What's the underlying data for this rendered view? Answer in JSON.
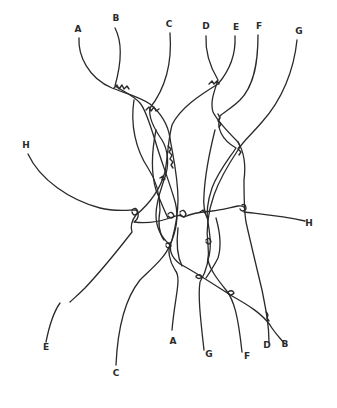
{
  "diagram": {
    "type": "hand-drawn braid / string crossing diagram",
    "top_labels": [
      {
        "text": "A",
        "x": 78,
        "y": 32
      },
      {
        "text": "B",
        "x": 116,
        "y": 21
      },
      {
        "text": "C",
        "x": 169,
        "y": 27
      },
      {
        "text": "D",
        "x": 206,
        "y": 29
      },
      {
        "text": "E",
        "x": 236,
        "y": 30
      },
      {
        "text": "F",
        "x": 259,
        "y": 29
      },
      {
        "text": "G",
        "x": 299,
        "y": 34
      }
    ],
    "left_labels": [
      {
        "text": "H",
        "x": 26,
        "y": 148
      }
    ],
    "right_labels": [
      {
        "text": "H",
        "x": 309,
        "y": 226
      }
    ],
    "bottom_labels": [
      {
        "text": "E",
        "x": 46,
        "y": 350
      },
      {
        "text": "C",
        "x": 116,
        "y": 376
      },
      {
        "text": "A",
        "x": 173,
        "y": 344
      },
      {
        "text": "G",
        "x": 209,
        "y": 357
      },
      {
        "text": "F",
        "x": 247,
        "y": 359
      },
      {
        "text": "D",
        "x": 267,
        "y": 348
      },
      {
        "text": "B",
        "x": 285,
        "y": 347
      }
    ]
  }
}
